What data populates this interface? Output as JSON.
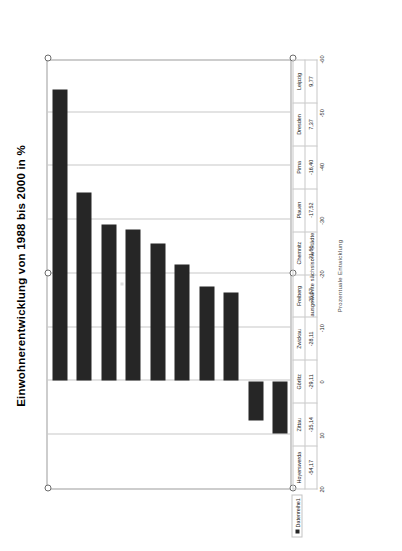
{
  "chart": {
    "title": "Einwohnerentwicklung von 1988 bis 2000 in %",
    "value_axis_title": "Prozentuale Entwicklung",
    "category_axis_title": "ausgewählte sächsische Städte",
    "legend_label": "Datenreihe1",
    "series_color": "#262626",
    "grid_color": "#c8c8c8",
    "frame_color": "#9b9b9b"
  },
  "chart_data": {
    "type": "bar",
    "orientation": "horizontal",
    "title": "Einwohnerentwicklung von 1988 bis 2000 in %",
    "xlabel": "ausgewählte sächsische Städte",
    "ylabel": "Prozentuale Entwicklung",
    "categories": [
      "Leipzig",
      "Dresden",
      "Pirna",
      "Plauen",
      "Chemnitz",
      "Freiberg",
      "Zwickau",
      "Görlitz",
      "Zittau",
      "Hoyerswerda"
    ],
    "values": [
      9.77,
      7.37,
      -16.4,
      -17.52,
      -21.61,
      -25.57,
      -28.11,
      -29.11,
      -35.14,
      -54.17
    ],
    "value_labels": [
      "9,77",
      "7,37",
      "-16,40",
      "-17,52",
      "-21,61",
      "-25,57",
      "-28,11",
      "-29,11",
      "-35,14",
      "-54,17"
    ],
    "ylim": [
      20,
      -60
    ],
    "yticks": [
      20,
      10,
      0,
      -10,
      -20,
      -30,
      -40,
      -50,
      -60
    ],
    "ytick_labels": [
      "20",
      "10",
      "0",
      "-10",
      "-20",
      "-30",
      "-40",
      "-50",
      "-60"
    ],
    "grid": true,
    "legend": [
      "Datenreihe1"
    ],
    "legend_position": "bottom-left",
    "series": [
      {
        "name": "Datenreihe1",
        "values": [
          9.77,
          7.37,
          -16.4,
          -17.52,
          -21.61,
          -25.57,
          -28.11,
          -29.11,
          -35.14,
          -54.17
        ]
      }
    ]
  }
}
